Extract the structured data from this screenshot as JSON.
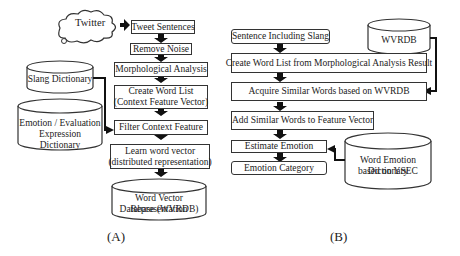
{
  "diagram_a": {
    "caption": "(A)",
    "source": "Twitter",
    "steps": [
      {
        "text": "Tweet Sentences"
      },
      {
        "text": "Remove Noise"
      },
      {
        "text": "Morphological Analysis"
      },
      {
        "line1": "Create Word List",
        "line2": "(Context Feature Vector)"
      },
      {
        "text": "Filter Context Feature"
      },
      {
        "line1": "Learn word vector",
        "line2": "(distributed representation)"
      }
    ],
    "databases": {
      "slang": "Slang Dictionary",
      "emotion_line1": "Emotion / Evaluation",
      "emotion_line2": "Expression Dictionary",
      "output_line1": "Word Vector Representation",
      "output_line2": "Database (WVRDB)"
    }
  },
  "diagram_b": {
    "caption": "(B)",
    "steps": [
      {
        "text": "Sentence Including Slang"
      },
      {
        "text": "Create Word List from Morphological Analysis Result"
      },
      {
        "text": "Acquire Similar Words based on WVRDB"
      },
      {
        "text": "Add Similar Words to Feature Vector"
      },
      {
        "text": "Estimate Emotion"
      },
      {
        "text": "Emotion Category"
      }
    ],
    "databases": {
      "wvrdb": "WVRDB",
      "dict_line1": "Word Emotion Dictionary",
      "dict_line2": "based on YSEC"
    }
  }
}
